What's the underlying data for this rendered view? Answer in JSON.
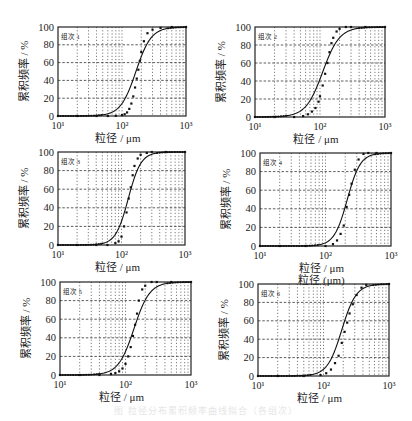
{
  "figure": {
    "caption": "图 粒径分布累积频率曲线拟合（各组次）"
  },
  "chart_data": [
    {
      "type": "line",
      "panel_label": "组次 1",
      "xlabel": "粒径 / μm",
      "ylabel": "累积频率 / %",
      "xscale": "log",
      "xlim": [
        10,
        1000
      ],
      "ylim": [
        0,
        100
      ],
      "xticks": [
        "10¹",
        "10²",
        "10³"
      ],
      "yticks": [
        0,
        20,
        40,
        60,
        80,
        100
      ],
      "grid": true,
      "d50": 165,
      "spread": 0.12,
      "frame": {
        "x0": 58,
        "x1": 186,
        "y0": 27,
        "y1": 116
      },
      "series": [
        {
          "name": "measured",
          "style": "markers",
          "x": [
            10,
            20,
            40,
            60,
            80,
            100,
            110,
            120,
            130,
            140,
            150,
            160,
            170,
            180,
            190,
            200,
            220,
            250,
            300,
            400,
            600,
            1000
          ],
          "y": [
            0,
            0,
            0,
            0,
            0.2,
            1,
            2,
            4,
            8,
            14,
            22,
            32,
            42,
            52,
            62,
            72,
            84,
            93,
            97,
            99,
            100,
            100
          ]
        },
        {
          "name": "fitted",
          "style": "line"
        }
      ]
    },
    {
      "type": "line",
      "panel_label": "组次 2",
      "xlabel": "粒径 / μm",
      "ylabel": "累积频率 / %",
      "xscale": "log",
      "xlim": [
        10,
        1000
      ],
      "ylim": [
        0,
        100
      ],
      "xticks": [
        "10¹",
        "10²",
        "10³"
      ],
      "yticks": [
        0,
        20,
        40,
        60,
        80,
        100
      ],
      "grid": true,
      "d50": 110,
      "spread": 0.13,
      "frame": {
        "x0": 255,
        "x1": 385,
        "y0": 27,
        "y1": 117
      },
      "series": [
        {
          "name": "measured",
          "style": "markers",
          "x": [
            10,
            20,
            40,
            55,
            65,
            75,
            85,
            95,
            100,
            110,
            120,
            130,
            140,
            150,
            160,
            180,
            200,
            250,
            300,
            500,
            1000
          ],
          "y": [
            0,
            0,
            0,
            1,
            3,
            6,
            10,
            17,
            23,
            35,
            48,
            60,
            72,
            82,
            88,
            95,
            98,
            100,
            100,
            100,
            100
          ]
        },
        {
          "name": "fitted",
          "style": "line"
        }
      ]
    },
    {
      "type": "line",
      "panel_label": "组次 3",
      "xlabel": "粒径 / μm",
      "ylabel": "累积频率 / %",
      "xscale": "log",
      "xlim": [
        10,
        1000
      ],
      "ylim": [
        0,
        100
      ],
      "xticks": [
        "10¹",
        "10²",
        "10³"
      ],
      "yticks": [
        0,
        20,
        40,
        60,
        80,
        100
      ],
      "grid": true,
      "d50": 128,
      "spread": 0.1,
      "frame": {
        "x0": 58,
        "x1": 185,
        "y0": 152,
        "y1": 245
      },
      "series": [
        {
          "name": "measured",
          "style": "markers",
          "x": [
            10,
            20,
            40,
            60,
            80,
            90,
            100,
            110,
            120,
            130,
            140,
            150,
            160,
            180,
            200,
            250,
            300,
            500,
            1000
          ],
          "y": [
            0,
            0,
            0,
            0,
            2,
            4,
            9,
            20,
            35,
            50,
            62,
            75,
            85,
            93,
            97,
            99,
            100,
            100,
            100
          ]
        },
        {
          "name": "fitted",
          "style": "line"
        }
      ]
    },
    {
      "type": "line",
      "panel_label": "组次 4",
      "xlabel": "粒径 / μm",
      "xlabel_secondary": "粒径 (μm)",
      "ylabel": "累积频率 / %",
      "xscale": "log",
      "xlim": [
        10,
        1000
      ],
      "ylim": [
        0,
        100
      ],
      "xticks": [
        "10¹",
        "10²",
        "10³"
      ],
      "yticks": [
        0,
        20,
        40,
        60,
        80,
        100
      ],
      "grid": true,
      "d50": 215,
      "spread": 0.1,
      "frame": {
        "x0": 260,
        "x1": 391,
        "y0": 153,
        "y1": 246
      },
      "series": [
        {
          "name": "measured",
          "style": "markers",
          "x": [
            10,
            20,
            50,
            100,
            130,
            150,
            170,
            190,
            210,
            230,
            250,
            280,
            320,
            380,
            450,
            600,
            1000
          ],
          "y": [
            0,
            0,
            0,
            0,
            2,
            6,
            13,
            22,
            42,
            55,
            67,
            82,
            93,
            99,
            100,
            100,
            100
          ]
        },
        {
          "name": "fitted",
          "style": "line"
        }
      ]
    },
    {
      "type": "line",
      "panel_label": "组次 5",
      "xlabel": "粒径 / μm",
      "ylabel": "累积频率 / %",
      "xscale": "log",
      "xlim": [
        10,
        1000
      ],
      "ylim": [
        0,
        100
      ],
      "xticks": [
        "10¹",
        "10²",
        "10³"
      ],
      "yticks": [
        0,
        20,
        40,
        60,
        80,
        100
      ],
      "grid": true,
      "d50": 135,
      "spread": 0.12,
      "frame": {
        "x0": 60,
        "x1": 191,
        "y0": 282,
        "y1": 375
      },
      "series": [
        {
          "name": "measured",
          "style": "markers",
          "x": [
            10,
            20,
            40,
            60,
            70,
            80,
            90,
            100,
            110,
            120,
            130,
            140,
            150,
            160,
            180,
            200,
            250,
            300,
            500,
            1000
          ],
          "y": [
            0,
            0,
            0,
            1,
            2,
            4,
            7,
            12,
            20,
            30,
            42,
            54,
            66,
            80,
            92,
            96,
            100,
            100,
            100,
            100
          ]
        },
        {
          "name": "fitted",
          "style": "line"
        }
      ]
    },
    {
      "type": "line",
      "panel_label": "组次 6",
      "xlabel": "粒径 / μm",
      "ylabel": "累积频率 / %",
      "xscale": "log",
      "xlim": [
        10,
        1000
      ],
      "ylim": [
        0,
        100
      ],
      "xticks": [
        "10¹",
        "10²",
        "10³"
      ],
      "yticks": [
        0,
        20,
        40,
        60,
        80,
        100
      ],
      "grid": true,
      "d50": 190,
      "spread": 0.11,
      "frame": {
        "x0": 258,
        "x1": 389,
        "y0": 284,
        "y1": 376
      },
      "series": [
        {
          "name": "measured",
          "style": "markers",
          "x": [
            10,
            20,
            50,
            90,
            110,
            130,
            150,
            170,
            190,
            210,
            230,
            250,
            280,
            320,
            380,
            450,
            1000
          ],
          "y": [
            0,
            0,
            0,
            1,
            3,
            7,
            14,
            22,
            36,
            48,
            58,
            68,
            78,
            88,
            96,
            99,
            100
          ]
        },
        {
          "name": "fitted",
          "style": "line"
        }
      ]
    }
  ]
}
